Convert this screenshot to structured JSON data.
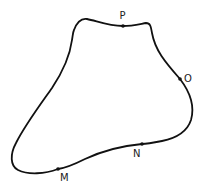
{
  "diagram": {
    "type": "closed-curve",
    "stroke_color": "#111111",
    "points": [
      {
        "name": "P",
        "label": "P"
      },
      {
        "name": "O",
        "label": "O"
      },
      {
        "name": "N",
        "label": "N"
      },
      {
        "name": "M",
        "label": "M"
      }
    ]
  }
}
